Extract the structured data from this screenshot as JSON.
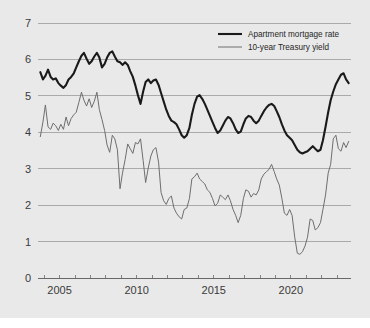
{
  "figure": {
    "background_color": "#e9e9e9",
    "plot_area": {
      "left": 38,
      "right": 351,
      "top": 23,
      "bottom": 278
    }
  },
  "legend": {
    "position": "top-right",
    "entries": [
      {
        "label": "Apartment mortgage rate",
        "color": "#1a1a1a",
        "line_width": 2.1
      },
      {
        "label": "10-year Treasury yield",
        "color": "#6e6e6e",
        "line_width": 1.0
      }
    ]
  },
  "chart_data": {
    "type": "line",
    "title": "",
    "subtitle": "",
    "xlabel": "",
    "ylabel": "",
    "xlim": [
      2003.6,
      2023.9
    ],
    "ylim": [
      0,
      7
    ],
    "grid": true,
    "y_ticks": [
      0,
      1,
      2,
      3,
      4,
      5,
      6,
      7
    ],
    "y_tick_labels": [
      "0",
      "1",
      "2",
      "3",
      "4",
      "5",
      "6",
      "7"
    ],
    "x_ticks": [
      2004,
      2005,
      2006,
      2007,
      2008,
      2009,
      2010,
      2011,
      2012,
      2013,
      2014,
      2015,
      2016,
      2017,
      2018,
      2019,
      2020,
      2021,
      2022,
      2023
    ],
    "x_tick_labels": [
      "2005",
      "2010",
      "2015",
      "2020"
    ],
    "x_labeled_ticks": [
      2005,
      2010,
      2015,
      2020
    ],
    "legend_position": "top-right",
    "series": [
      {
        "name": "Apartment mortgage rate",
        "color": "#1a1a1a",
        "x": [
          2003.75,
          2003.92,
          2004.08,
          2004.25,
          2004.42,
          2004.58,
          2004.75,
          2004.92,
          2005.08,
          2005.25,
          2005.42,
          2005.58,
          2005.75,
          2005.92,
          2006.08,
          2006.25,
          2006.42,
          2006.58,
          2006.75,
          2006.92,
          2007.08,
          2007.25,
          2007.42,
          2007.58,
          2007.75,
          2007.92,
          2008.08,
          2008.25,
          2008.42,
          2008.58,
          2008.75,
          2008.92,
          2009.08,
          2009.25,
          2009.42,
          2009.58,
          2009.75,
          2009.92,
          2010.08,
          2010.25,
          2010.42,
          2010.58,
          2010.75,
          2010.92,
          2011.08,
          2011.25,
          2011.42,
          2011.58,
          2011.75,
          2011.92,
          2012.08,
          2012.25,
          2012.42,
          2012.58,
          2012.75,
          2012.92,
          2013.08,
          2013.25,
          2013.42,
          2013.58,
          2013.75,
          2013.92,
          2014.08,
          2014.25,
          2014.42,
          2014.58,
          2014.75,
          2014.92,
          2015.08,
          2015.25,
          2015.42,
          2015.58,
          2015.75,
          2015.92,
          2016.08,
          2016.25,
          2016.42,
          2016.58,
          2016.75,
          2016.92,
          2017.08,
          2017.25,
          2017.42,
          2017.58,
          2017.75,
          2017.92,
          2018.08,
          2018.25,
          2018.42,
          2018.58,
          2018.75,
          2018.92,
          2019.08,
          2019.25,
          2019.42,
          2019.58,
          2019.75,
          2019.92,
          2020.08,
          2020.25,
          2020.42,
          2020.58,
          2020.75,
          2020.92,
          2021.08,
          2021.25,
          2021.42,
          2021.58,
          2021.75,
          2021.92,
          2022.08,
          2022.25,
          2022.42,
          2022.58,
          2022.75,
          2022.92,
          2023.08,
          2023.25,
          2023.42,
          2023.58,
          2023.75
        ],
        "y": [
          5.65,
          5.45,
          5.55,
          5.72,
          5.52,
          5.45,
          5.48,
          5.35,
          5.28,
          5.22,
          5.3,
          5.45,
          5.52,
          5.62,
          5.78,
          5.95,
          6.1,
          6.18,
          6.02,
          5.88,
          5.95,
          6.08,
          6.18,
          6.05,
          5.78,
          5.88,
          6.05,
          6.18,
          6.22,
          6.08,
          5.95,
          5.92,
          5.85,
          5.92,
          5.85,
          5.68,
          5.52,
          5.28,
          5.02,
          4.78,
          5.12,
          5.38,
          5.45,
          5.35,
          5.42,
          5.45,
          5.3,
          5.08,
          4.85,
          4.62,
          4.45,
          4.32,
          4.28,
          4.22,
          4.08,
          3.92,
          3.85,
          3.92,
          4.12,
          4.48,
          4.78,
          4.98,
          5.02,
          4.92,
          4.78,
          4.62,
          4.45,
          4.28,
          4.12,
          3.98,
          4.05,
          4.18,
          4.32,
          4.42,
          4.38,
          4.25,
          4.08,
          3.98,
          4.02,
          4.22,
          4.38,
          4.45,
          4.42,
          4.32,
          4.25,
          4.32,
          4.45,
          4.58,
          4.68,
          4.75,
          4.78,
          4.72,
          4.58,
          4.42,
          4.22,
          4.05,
          3.92,
          3.85,
          3.78,
          3.65,
          3.52,
          3.45,
          3.42,
          3.45,
          3.48,
          3.55,
          3.62,
          3.55,
          3.48,
          3.52,
          3.78,
          4.15,
          4.55,
          4.88,
          5.12,
          5.32,
          5.45,
          5.58,
          5.62,
          5.45,
          5.35
        ]
      },
      {
        "name": "10-year Treasury yield",
        "color": "#6e6e6e",
        "x": [
          2003.75,
          2003.92,
          2004.08,
          2004.25,
          2004.42,
          2004.58,
          2004.75,
          2004.92,
          2005.08,
          2005.25,
          2005.42,
          2005.58,
          2005.75,
          2005.92,
          2006.08,
          2006.25,
          2006.42,
          2006.58,
          2006.75,
          2006.92,
          2007.08,
          2007.25,
          2007.42,
          2007.58,
          2007.75,
          2007.92,
          2008.08,
          2008.25,
          2008.42,
          2008.58,
          2008.75,
          2008.92,
          2009.08,
          2009.25,
          2009.42,
          2009.58,
          2009.75,
          2009.92,
          2010.08,
          2010.25,
          2010.42,
          2010.58,
          2010.75,
          2010.92,
          2011.08,
          2011.25,
          2011.42,
          2011.58,
          2011.75,
          2011.92,
          2012.08,
          2012.25,
          2012.42,
          2012.58,
          2012.75,
          2012.92,
          2013.08,
          2013.25,
          2013.42,
          2013.58,
          2013.75,
          2013.92,
          2014.08,
          2014.25,
          2014.42,
          2014.58,
          2014.75,
          2014.92,
          2015.08,
          2015.25,
          2015.42,
          2015.58,
          2015.75,
          2015.92,
          2016.08,
          2016.25,
          2016.42,
          2016.58,
          2016.75,
          2016.92,
          2017.08,
          2017.25,
          2017.42,
          2017.58,
          2017.75,
          2017.92,
          2018.08,
          2018.25,
          2018.42,
          2018.58,
          2018.75,
          2018.92,
          2019.08,
          2019.25,
          2019.42,
          2019.58,
          2019.75,
          2019.92,
          2020.08,
          2020.25,
          2020.42,
          2020.58,
          2020.75,
          2020.92,
          2021.08,
          2021.25,
          2021.42,
          2021.58,
          2021.75,
          2021.92,
          2022.08,
          2022.25,
          2022.42,
          2022.58,
          2022.75,
          2022.92,
          2023.08,
          2023.25,
          2023.42,
          2023.58,
          2023.75
        ],
        "y": [
          3.88,
          4.28,
          4.75,
          4.15,
          4.08,
          4.25,
          4.18,
          4.05,
          4.22,
          4.08,
          4.42,
          4.18,
          4.38,
          4.48,
          4.55,
          4.82,
          5.1,
          4.88,
          4.72,
          4.92,
          4.68,
          4.85,
          5.1,
          4.62,
          4.35,
          4.05,
          3.65,
          3.45,
          3.92,
          3.82,
          3.52,
          2.45,
          2.88,
          3.25,
          3.68,
          3.55,
          3.42,
          3.72,
          3.68,
          3.82,
          3.22,
          2.62,
          3.02,
          3.35,
          3.52,
          3.58,
          3.18,
          2.35,
          2.12,
          2.02,
          2.18,
          2.25,
          1.92,
          1.78,
          1.68,
          1.62,
          1.88,
          1.92,
          2.18,
          2.72,
          2.78,
          2.88,
          2.72,
          2.65,
          2.58,
          2.42,
          2.35,
          2.18,
          1.98,
          2.05,
          2.28,
          2.22,
          2.15,
          2.28,
          2.12,
          1.88,
          1.72,
          1.52,
          1.72,
          2.18,
          2.42,
          2.38,
          2.22,
          2.32,
          2.28,
          2.42,
          2.72,
          2.85,
          2.92,
          2.98,
          3.12,
          2.92,
          2.72,
          2.55,
          2.18,
          1.78,
          1.72,
          1.88,
          1.72,
          1.12,
          0.68,
          0.65,
          0.72,
          0.88,
          1.12,
          1.62,
          1.58,
          1.32,
          1.38,
          1.52,
          1.88,
          2.28,
          2.88,
          3.12,
          3.82,
          3.92,
          3.55,
          3.48,
          3.72,
          3.58,
          3.75
        ]
      }
    ]
  }
}
